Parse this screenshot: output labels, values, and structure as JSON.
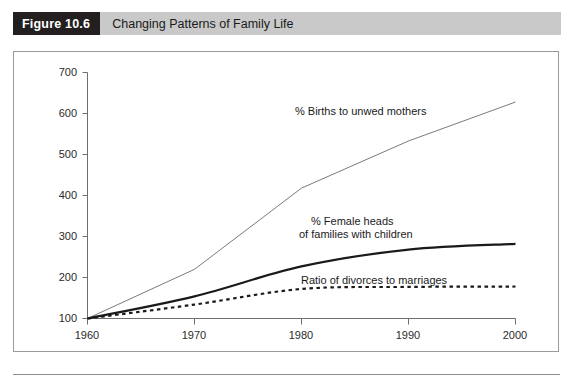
{
  "figure": {
    "tag": "Figure 10.6",
    "caption": "Changing Patterns of Family Life"
  },
  "colors": {
    "tag_background": "#231f20",
    "tag_text": "#ffffff",
    "caption_background": "#c9c9c9",
    "caption_text": "#1a1a1a",
    "frame_border": "#9a9a9a",
    "axis": "#6e6e6e",
    "series_thin": "#7a7a7a",
    "series_thick": "#1a1a1a",
    "series_dotted": "#1a1a1a",
    "plot_background": "#ffffff"
  },
  "chart_data": {
    "type": "line",
    "title": "Changing Patterns of Family Life",
    "xlabel": "",
    "ylabel": "",
    "x": [
      1960,
      1970,
      1980,
      1990,
      2000
    ],
    "xtick_labels": [
      "1960",
      "1970",
      "1980",
      "1990",
      "2000"
    ],
    "xlim": [
      1960,
      2000
    ],
    "ytick_labels": [
      "100",
      "200",
      "300",
      "400",
      "500",
      "600",
      "700"
    ],
    "yticks": [
      100,
      200,
      300,
      400,
      500,
      600,
      700
    ],
    "ylim": [
      100,
      700
    ],
    "grid": false,
    "legend_position": "inline-annotations",
    "note": "Index values, 1960 = 100",
    "series": [
      {
        "name": "% Births to unwed mothers",
        "style": "thin-solid",
        "values": [
          100,
          220,
          418,
          533,
          628
        ]
      },
      {
        "name": "% Female heads of families with children",
        "style": "thick-solid",
        "values": [
          100,
          154,
          227,
          268,
          282
        ]
      },
      {
        "name": "Ratio of divorces to marriages",
        "style": "dotted",
        "values": [
          100,
          134,
          172,
          177,
          178
        ]
      }
    ],
    "annotations": [
      {
        "text": "% Births to unwed mothers",
        "x": 1985,
        "y": 600
      },
      {
        "text": "% Female heads",
        "x": 1986,
        "y": 340
      },
      {
        "text": "of families with children",
        "x": 1986,
        "y": 315
      },
      {
        "text": "Ratio of divorces to marriages",
        "x": 1985,
        "y": 215
      }
    ]
  },
  "axis_labels": {
    "y": [
      "700",
      "600",
      "500",
      "400",
      "300",
      "200",
      "100"
    ],
    "x": [
      "1960",
      "1970",
      "1980",
      "1990",
      "2000"
    ]
  },
  "series_labels": {
    "unwed": "% Births to unwed mothers",
    "female_heads_line1": "% Female heads",
    "female_heads_line2": "of families with children",
    "divorces": "Ratio of divorces to marriages"
  }
}
